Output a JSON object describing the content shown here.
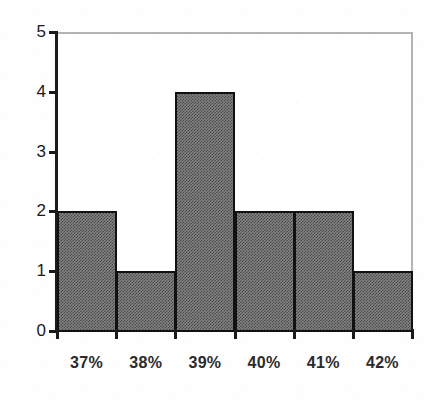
{
  "chart_data": {
    "type": "bar",
    "title": "",
    "subtitle": "",
    "xlabel": "",
    "ylabel": "",
    "categories": [
      "37%",
      "38%",
      "39%",
      "40%",
      "41%",
      "42%"
    ],
    "values": [
      2,
      1,
      4,
      2,
      2,
      1
    ],
    "series": [
      {
        "name": "Frequency",
        "values": [
          2,
          1,
          4,
          2,
          2,
          1
        ]
      }
    ],
    "ylim": [
      0,
      5
    ],
    "yticks": [
      0,
      1,
      2,
      3,
      4,
      5
    ],
    "ytick_labels": [
      "0",
      "1",
      "2",
      "3",
      "4",
      "5"
    ],
    "xtick_labels": [
      "37%",
      "38%",
      "39%",
      "40%",
      "41%",
      "42%"
    ],
    "grid": false,
    "legend": null,
    "legend_position": "none",
    "bar_style": "adjacent-histogram",
    "annotations": []
  },
  "style": {
    "bar_fill": "#848484",
    "bar_edge": "#111111",
    "axis_color": "#1a1a1a",
    "frame_color": "#b4b4b4",
    "background": "#fefefe",
    "tick_label_color": "#1a1a1a",
    "category_label_color": "#2b2b2b"
  }
}
